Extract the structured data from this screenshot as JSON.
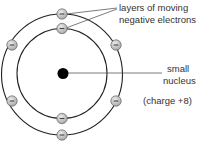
{
  "diagram": {
    "labels": {
      "electrons_line1": "layers of moving",
      "electrons_line2": "negative electrons",
      "nucleus_line1": "small",
      "nucleus_line2": "nucleus",
      "charge": "(charge +8)"
    },
    "electron_symbol": "minus-icon",
    "colors": {
      "orbit": "#222222",
      "nucleus": "#000000",
      "electron_fill": "#c8c8c8",
      "electron_stroke": "#666666",
      "text": "#333333"
    },
    "shells": [
      {
        "name": "inner-shell",
        "electrons": 2
      },
      {
        "name": "outer-shell",
        "electrons": 6
      }
    ],
    "nucleus_charge": "+8"
  }
}
